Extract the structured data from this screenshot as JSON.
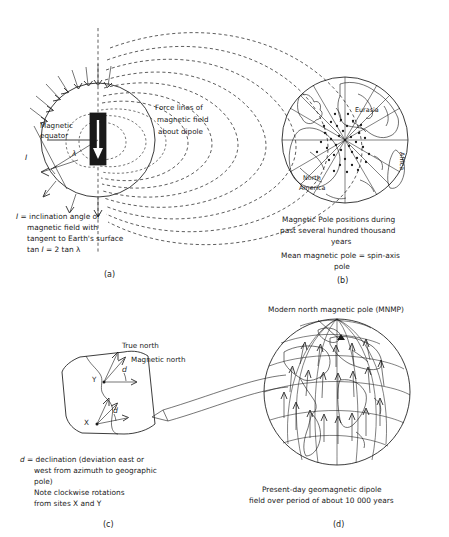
{
  "figure": {
    "background": "#ffffff",
    "ink": "#1a1a1a"
  },
  "panel_a": {
    "label": "(a)",
    "annotations": {
      "force_lines_l1": "Force lines of",
      "force_lines_l2": "magnetic field",
      "force_lines_l3": "about dipole",
      "equator_l1": "Magnetic",
      "equator_l2": "equator",
      "inclination_symbol": "I",
      "latitude_symbol": "λ"
    },
    "caption": {
      "l1_sym": "I",
      "l1": " = inclination angle of",
      "l2": "magnetic field with",
      "l3": "tangent to Earth's surface",
      "l4_a": "tan ",
      "l4_sym": "I",
      "l4_b": " = 2 tan λ"
    }
  },
  "panel_b": {
    "label": "(b)",
    "map_labels": {
      "eurasia": "Eurasia",
      "africa": "Africa",
      "north_america_l1": "North",
      "north_america_l2": "America"
    },
    "caption": {
      "l1": "Magnetic Pole positions during",
      "l2": "past several hundred thousand",
      "l3": "years",
      "l4": "Mean magnetic pole = spin-axis",
      "l5": "pole"
    }
  },
  "panel_c": {
    "label": "(c)",
    "annotations": {
      "true_north": "True north",
      "magnetic_north": "Magnetic north",
      "declination_y": "d",
      "declination_x": "d",
      "site_x": "X",
      "site_y": "Y"
    },
    "caption": {
      "l1_sym": "d",
      "l1": " = declination (deviation east or",
      "l2": "west from azimuth to geographic",
      "l3": "pole)",
      "l4": "Note clockwise rotations",
      "l5": "from sites X and Y"
    }
  },
  "panel_d": {
    "label": "(d)",
    "annotations": {
      "mnmp": "Modern north magnetic pole (MNMP)"
    },
    "caption": {
      "l1": "Present-day geomagnetic dipole",
      "l2": "field over period of about 10 000 years"
    }
  }
}
